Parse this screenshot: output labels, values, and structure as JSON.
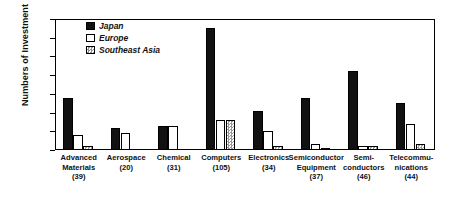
{
  "chart_data": {
    "type": "bar",
    "title": "",
    "xlabel": "",
    "ylabel": "Numbers of Investment",
    "ylim": [
      0,
      70
    ],
    "yticks": [
      0,
      10,
      20,
      30,
      40,
      50,
      60,
      70
    ],
    "grid": false,
    "legend_position": "top-left-inside",
    "categories": [
      "Advanced Materials",
      "Aerospace",
      "Chemical",
      "Computers",
      "Electronics",
      "Semiconductor Equipment",
      "Semi-conductors",
      "Telecommu-nications"
    ],
    "category_labels": [
      {
        "name": "Advanced Materials",
        "line1": "Advanced",
        "line2": "Materials",
        "count": "(39)"
      },
      {
        "name": "Aerospace",
        "line1": "Aerospace",
        "line2": "",
        "count": "(20)"
      },
      {
        "name": "Chemical",
        "line1": "Chemical",
        "line2": "",
        "count": "(31)"
      },
      {
        "name": "Computers",
        "line1": "Computers",
        "line2": "",
        "count": "(105)"
      },
      {
        "name": "Electronics",
        "line1": "Electronics",
        "line2": "",
        "count": "(34)"
      },
      {
        "name": "Semiconductor Equipment",
        "line1": "Semiconductor",
        "line2": "Equipment",
        "count": "(37)"
      },
      {
        "name": "Semiconductors",
        "line1": "Semi-",
        "line2": "conductors",
        "count": "(46)"
      },
      {
        "name": "Telecommunications",
        "line1": "Telecommu-",
        "line2": "nications",
        "count": "(44)"
      }
    ],
    "series": [
      {
        "name": "Japan",
        "fill": "solid-black",
        "values": [
          28,
          12,
          13,
          65,
          21,
          28,
          42,
          25
        ]
      },
      {
        "name": "Europe",
        "fill": "white",
        "values": [
          8,
          9,
          13,
          16,
          10,
          3,
          2,
          14
        ]
      },
      {
        "name": "Southeast Asia",
        "fill": "checkered",
        "values": [
          2,
          0,
          0,
          16,
          2,
          1,
          2,
          3
        ]
      }
    ]
  },
  "legend": {
    "items": [
      {
        "label": "Japan"
      },
      {
        "label": "Europe"
      },
      {
        "label": "Southeast Asia"
      }
    ]
  },
  "axes": {
    "y_title": "Numbers of Investment",
    "y_tick_labels": [
      "70",
      "60",
      "50",
      "40",
      "30",
      "20",
      "10",
      "0"
    ]
  }
}
